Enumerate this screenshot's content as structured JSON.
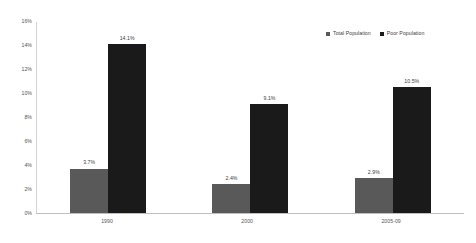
{
  "chart_data": {
    "type": "bar",
    "title": "",
    "subtitle": "",
    "xlabel": "",
    "ylabel": "",
    "categories": [
      "1990",
      "2000",
      "2005-09"
    ],
    "series": [
      {
        "name": "Total Population",
        "color": "#595959",
        "values": [
          3.7,
          2.4,
          2.9
        ],
        "labels": [
          "3.7%",
          "2.4%",
          "2.9%"
        ]
      },
      {
        "name": "Poor Population",
        "color": "#1a1a1a",
        "values": [
          14.1,
          9.1,
          10.5
        ],
        "labels": [
          "14.1%",
          "9.1%",
          "10.5%"
        ]
      }
    ],
    "ylim": [
      0,
      16
    ],
    "ytick_values": [
      16,
      14,
      12,
      10,
      8,
      6,
      4,
      2,
      0
    ],
    "ytick_labels": [
      "16%",
      "14%",
      "12%",
      "10%",
      "8%",
      "6%",
      "4%",
      "2%",
      "0%"
    ],
    "grid": false,
    "legend_position": "top-right",
    "value_labels_shown": true
  }
}
